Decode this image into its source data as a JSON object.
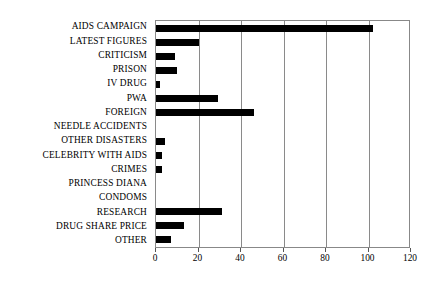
{
  "chart_data": {
    "type": "bar",
    "orientation": "horizontal",
    "title": "",
    "subtitle": "",
    "xlabel": "",
    "ylabel": "",
    "xlim": [
      0,
      120
    ],
    "xticks": [
      0,
      20,
      40,
      60,
      80,
      100,
      120
    ],
    "grid": true,
    "legend": false,
    "legend_position": "none",
    "bar_color": "#000000",
    "background_color": "#ffffff",
    "axis_color": "#8a8a8a",
    "categories": [
      "AIDS CAMPAIGN",
      "LATEST FIGURES",
      "CRITICISM",
      "PRISON",
      "IV DRUG",
      "PWA",
      "FOREIGN",
      "NEEDLE ACCIDENTS",
      "OTHER DISASTERS",
      "CELEBRITY WITH AIDS",
      "CRIMES",
      "PRINCESS DIANA",
      "CONDOMS",
      "RESEARCH",
      "DRUG SHARE PRICE",
      "OTHER"
    ],
    "values": [
      102,
      20,
      9,
      10,
      2,
      29,
      46,
      0,
      4,
      3,
      3,
      0,
      0,
      31,
      13,
      7
    ]
  }
}
